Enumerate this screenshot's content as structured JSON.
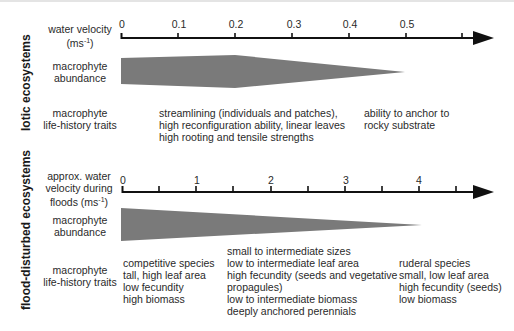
{
  "sections": {
    "lotic": {
      "title": "lotic ecosystems",
      "axis_label_line1": "water velocity",
      "axis_label_line2": "(ms",
      "axis_label_unit_sup": "-1",
      "axis_label_close": ")",
      "tick_labels": [
        "0",
        "0.1",
        "0.2",
        "0.3",
        "0.4",
        "0.5"
      ],
      "abundance_label_line1": "macrophyte",
      "abundance_label_line2": "abundance",
      "traits_label_line1": "macrophyte",
      "traits_label_line2": "life-history traits",
      "traits_groups": [
        [
          "streamlining (individuals and patches),",
          "high reconfiguration ability, linear leaves",
          "high rooting and tensile strengths"
        ],
        [
          "ability to anchor to",
          "rocky substrate"
        ]
      ]
    },
    "flood": {
      "title": "flood-disturbed ecosystems",
      "axis_label_line1": "approx. water",
      "axis_label_line2": "velocity during",
      "axis_label_line3": "floods (ms",
      "axis_label_unit_sup": "-1",
      "axis_label_close": ")",
      "tick_labels": [
        "0",
        "1",
        "2",
        "3",
        "4"
      ],
      "abundance_label_line1": "macrophyte",
      "abundance_label_line2": "abundance",
      "traits_label_line1": "macrophyte",
      "traits_label_line2": "life-history traits",
      "traits_groups": [
        [
          "competitive species",
          "tall, high leaf area",
          "low fecundity",
          "high biomass"
        ],
        [
          "small to intermediate sizes",
          "low to intermediate leaf area",
          "high fecundity (seeds and vegetative",
          "propagules)",
          "low to intermediate biomass",
          "deeply anchored perennials"
        ],
        [
          "ruderal species",
          "small, low leaf area",
          "high fecundity (seeds)",
          "low biomass"
        ]
      ]
    }
  },
  "colors": {
    "axis": "#111111",
    "abundance_fill": "#7a7a7a",
    "text": "#2a2a2a"
  }
}
